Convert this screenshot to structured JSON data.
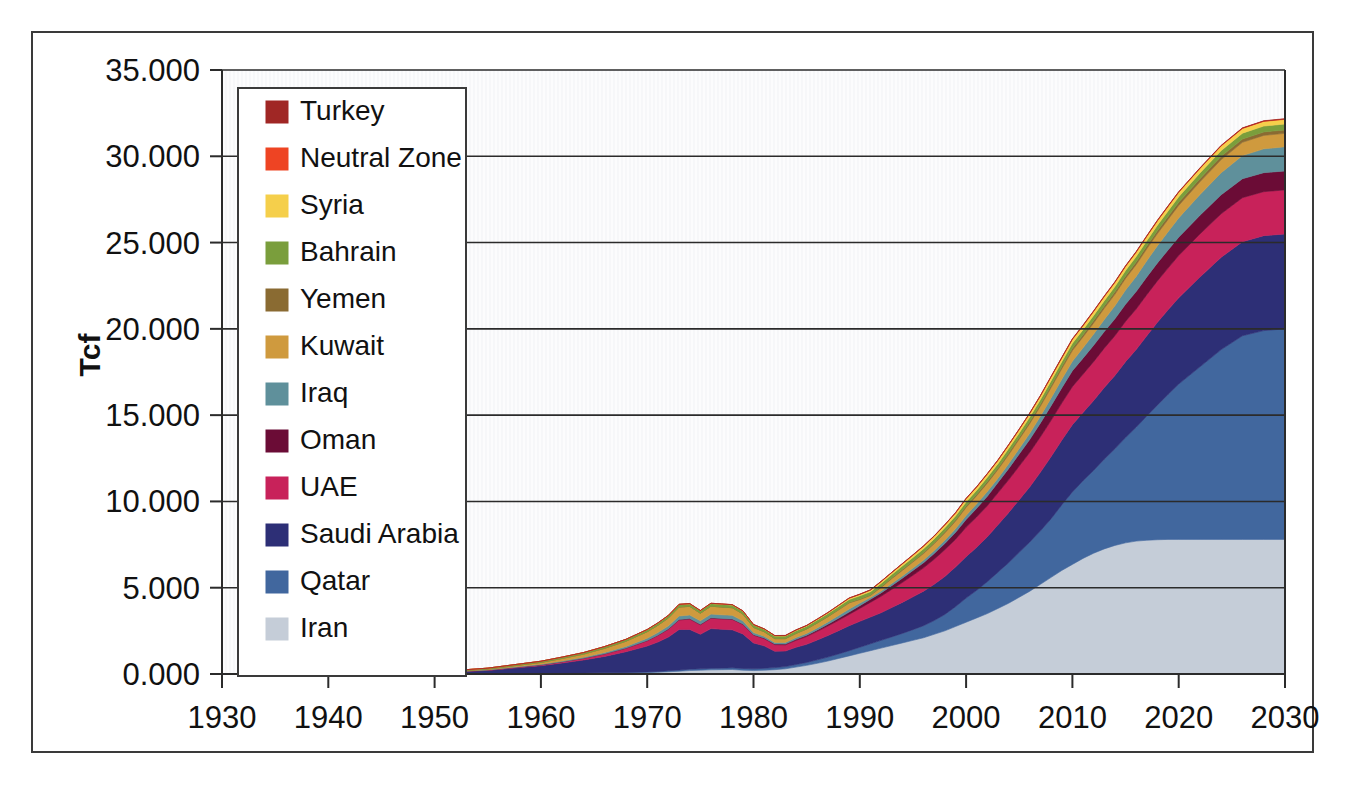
{
  "chart_data": {
    "type": "area",
    "stacked": true,
    "title": "",
    "xlabel": "",
    "ylabel": "Tcf",
    "xlim": [
      1930,
      2030
    ],
    "ylim": [
      0,
      35
    ],
    "xticks": [
      1930,
      1940,
      1950,
      1960,
      1970,
      1980,
      1990,
      2000,
      2010,
      2020,
      2030
    ],
    "xtick_labels": [
      "1930",
      "1940",
      "1950",
      "1960",
      "1970",
      "1980",
      "1990",
      "2000",
      "2010",
      "2020",
      "2030"
    ],
    "yticks": [
      0,
      5,
      10,
      15,
      20,
      25,
      30,
      35
    ],
    "ytick_labels": [
      "0.000",
      "5.000",
      "10.000",
      "15.000",
      "20.000",
      "25.000",
      "30.000",
      "35.000"
    ],
    "grid": "horizontal",
    "legend_position": "upper-left-inside",
    "legend_order_top_to_bottom": [
      "Turkey",
      "Neutral Zone",
      "Syria",
      "Bahrain",
      "Yemen",
      "Kuwait",
      "Iraq",
      "Oman",
      "UAE",
      "Saudi Arabia",
      "Qatar",
      "Iran"
    ],
    "x": [
      1930,
      1935,
      1940,
      1945,
      1950,
      1955,
      1960,
      1962,
      1964,
      1966,
      1968,
      1970,
      1971,
      1972,
      1973,
      1974,
      1975,
      1976,
      1977,
      1978,
      1979,
      1980,
      1981,
      1982,
      1983,
      1984,
      1985,
      1986,
      1987,
      1988,
      1989,
      1990,
      1991,
      1992,
      1993,
      1994,
      1995,
      1996,
      1997,
      1998,
      1999,
      2000,
      2001,
      2002,
      2003,
      2004,
      2005,
      2006,
      2007,
      2008,
      2009,
      2010,
      2011,
      2012,
      2013,
      2014,
      2015,
      2016,
      2017,
      2018,
      2019,
      2020,
      2022,
      2024,
      2026,
      2028,
      2030
    ],
    "series": [
      {
        "name": "Iran",
        "color": "#c5cdd8",
        "values": [
          0.0,
          0.0,
          0.0,
          0.0,
          0.0,
          0.01,
          0.02,
          0.03,
          0.04,
          0.05,
          0.06,
          0.08,
          0.1,
          0.13,
          0.16,
          0.2,
          0.22,
          0.24,
          0.25,
          0.26,
          0.22,
          0.2,
          0.22,
          0.25,
          0.3,
          0.4,
          0.5,
          0.62,
          0.75,
          0.9,
          1.05,
          1.2,
          1.35,
          1.5,
          1.65,
          1.8,
          1.95,
          2.1,
          2.3,
          2.5,
          2.75,
          3.0,
          3.25,
          3.5,
          3.8,
          4.1,
          4.45,
          4.8,
          5.2,
          5.6,
          6.0,
          6.35,
          6.7,
          7.0,
          7.25,
          7.45,
          7.6,
          7.7,
          7.75,
          7.78,
          7.8,
          7.8,
          7.8,
          7.8,
          7.8,
          7.8,
          7.8
        ]
      },
      {
        "name": "Qatar",
        "color": "#41679e",
        "values": [
          0.0,
          0.0,
          0.0,
          0.0,
          0.0,
          0.0,
          0.01,
          0.01,
          0.02,
          0.02,
          0.03,
          0.04,
          0.05,
          0.06,
          0.07,
          0.08,
          0.08,
          0.09,
          0.09,
          0.1,
          0.1,
          0.1,
          0.11,
          0.12,
          0.13,
          0.15,
          0.17,
          0.2,
          0.23,
          0.26,
          0.3,
          0.35,
          0.4,
          0.45,
          0.5,
          0.55,
          0.62,
          0.7,
          0.8,
          0.95,
          1.15,
          1.4,
          1.6,
          1.85,
          2.1,
          2.35,
          2.6,
          2.85,
          3.1,
          3.4,
          3.8,
          4.2,
          4.5,
          4.8,
          5.2,
          5.6,
          6.1,
          6.6,
          7.2,
          7.8,
          8.4,
          9.0,
          10.0,
          11.0,
          11.8,
          12.1,
          12.2
        ]
      },
      {
        "name": "Saudi Arabia",
        "color": "#2d2f76",
        "values": [
          0.0,
          0.0,
          0.0,
          0.02,
          0.08,
          0.2,
          0.45,
          0.6,
          0.75,
          0.95,
          1.2,
          1.5,
          1.7,
          1.95,
          2.35,
          2.3,
          2.0,
          2.3,
          2.25,
          2.2,
          2.0,
          1.5,
          1.3,
          0.95,
          0.9,
          1.0,
          1.05,
          1.15,
          1.25,
          1.35,
          1.45,
          1.5,
          1.55,
          1.6,
          1.7,
          1.8,
          1.9,
          2.0,
          2.1,
          2.2,
          2.3,
          2.4,
          2.5,
          2.6,
          2.75,
          2.9,
          3.05,
          3.2,
          3.4,
          3.6,
          3.75,
          3.9,
          3.95,
          4.05,
          4.15,
          4.25,
          4.4,
          4.5,
          4.65,
          4.8,
          4.9,
          5.0,
          5.2,
          5.35,
          5.45,
          5.5,
          5.5
        ]
      },
      {
        "name": "UAE",
        "color": "#c8225a",
        "values": [
          0.0,
          0.0,
          0.0,
          0.0,
          0.0,
          0.02,
          0.05,
          0.07,
          0.1,
          0.14,
          0.2,
          0.3,
          0.38,
          0.45,
          0.55,
          0.6,
          0.55,
          0.6,
          0.6,
          0.6,
          0.55,
          0.45,
          0.42,
          0.38,
          0.36,
          0.4,
          0.45,
          0.5,
          0.55,
          0.6,
          0.65,
          0.75,
          0.85,
          0.95,
          1.05,
          1.15,
          1.25,
          1.35,
          1.45,
          1.55,
          1.6,
          1.7,
          1.75,
          1.8,
          1.85,
          1.9,
          1.95,
          2.0,
          2.05,
          2.1,
          2.15,
          2.2,
          2.22,
          2.25,
          2.28,
          2.3,
          2.33,
          2.35,
          2.38,
          2.4,
          2.42,
          2.45,
          2.5,
          2.52,
          2.55,
          2.55,
          2.55
        ]
      },
      {
        "name": "Oman",
        "color": "#6b0c36",
        "values": [
          0.0,
          0.0,
          0.0,
          0.0,
          0.0,
          0.0,
          0.0,
          0.0,
          0.0,
          0.01,
          0.01,
          0.02,
          0.02,
          0.03,
          0.03,
          0.03,
          0.03,
          0.03,
          0.03,
          0.03,
          0.03,
          0.03,
          0.04,
          0.04,
          0.05,
          0.06,
          0.07,
          0.08,
          0.1,
          0.12,
          0.14,
          0.16,
          0.18,
          0.2,
          0.22,
          0.25,
          0.28,
          0.3,
          0.33,
          0.36,
          0.4,
          0.45,
          0.5,
          0.55,
          0.6,
          0.65,
          0.7,
          0.75,
          0.8,
          0.85,
          0.88,
          0.92,
          0.93,
          0.95,
          0.96,
          0.98,
          1.0,
          1.01,
          1.03,
          1.04,
          1.05,
          1.06,
          1.08,
          1.1,
          1.1,
          1.1,
          1.1
        ]
      },
      {
        "name": "Iraq",
        "color": "#5f909b",
        "values": [
          0.0,
          0.0,
          0.0,
          0.0,
          0.0,
          0.02,
          0.04,
          0.05,
          0.06,
          0.08,
          0.1,
          0.13,
          0.15,
          0.17,
          0.2,
          0.21,
          0.2,
          0.21,
          0.21,
          0.21,
          0.18,
          0.12,
          0.1,
          0.09,
          0.09,
          0.1,
          0.11,
          0.12,
          0.14,
          0.16,
          0.18,
          0.15,
          0.1,
          0.11,
          0.12,
          0.13,
          0.14,
          0.15,
          0.17,
          0.19,
          0.21,
          0.24,
          0.26,
          0.28,
          0.25,
          0.28,
          0.32,
          0.36,
          0.4,
          0.45,
          0.5,
          0.55,
          0.6,
          0.65,
          0.7,
          0.76,
          0.82,
          0.88,
          0.94,
          1.0,
          1.06,
          1.12,
          1.2,
          1.28,
          1.34,
          1.38,
          1.4
        ]
      },
      {
        "name": "Kuwait",
        "color": "#cf9a3e",
        "values": [
          0.0,
          0.0,
          0.0,
          0.0,
          0.01,
          0.04,
          0.1,
          0.14,
          0.18,
          0.24,
          0.3,
          0.38,
          0.42,
          0.46,
          0.52,
          0.5,
          0.44,
          0.46,
          0.45,
          0.44,
          0.4,
          0.3,
          0.26,
          0.22,
          0.22,
          0.24,
          0.26,
          0.28,
          0.3,
          0.32,
          0.35,
          0.2,
          0.12,
          0.2,
          0.28,
          0.32,
          0.35,
          0.38,
          0.4,
          0.42,
          0.44,
          0.46,
          0.47,
          0.48,
          0.5,
          0.52,
          0.54,
          0.56,
          0.58,
          0.6,
          0.61,
          0.62,
          0.63,
          0.64,
          0.65,
          0.66,
          0.67,
          0.68,
          0.69,
          0.7,
          0.71,
          0.72,
          0.74,
          0.76,
          0.77,
          0.78,
          0.78
        ]
      },
      {
        "name": "Yemen",
        "color": "#8a6b32",
        "values": [
          0.0,
          0.0,
          0.0,
          0.0,
          0.0,
          0.0,
          0.0,
          0.0,
          0.0,
          0.0,
          0.0,
          0.0,
          0.0,
          0.0,
          0.0,
          0.0,
          0.0,
          0.0,
          0.0,
          0.0,
          0.0,
          0.0,
          0.0,
          0.0,
          0.0,
          0.0,
          0.0,
          0.01,
          0.01,
          0.02,
          0.02,
          0.03,
          0.03,
          0.04,
          0.04,
          0.05,
          0.05,
          0.06,
          0.06,
          0.07,
          0.07,
          0.08,
          0.08,
          0.09,
          0.09,
          0.1,
          0.1,
          0.11,
          0.11,
          0.12,
          0.12,
          0.13,
          0.13,
          0.14,
          0.14,
          0.15,
          0.15,
          0.16,
          0.16,
          0.17,
          0.17,
          0.18,
          0.18,
          0.19,
          0.19,
          0.2,
          0.2
        ]
      },
      {
        "name": "Bahrain",
        "color": "#7a9e3c",
        "values": [
          0.0,
          0.0,
          0.01,
          0.02,
          0.03,
          0.05,
          0.07,
          0.08,
          0.09,
          0.1,
          0.11,
          0.12,
          0.13,
          0.14,
          0.15,
          0.15,
          0.15,
          0.16,
          0.16,
          0.16,
          0.16,
          0.15,
          0.15,
          0.15,
          0.15,
          0.16,
          0.16,
          0.17,
          0.17,
          0.18,
          0.18,
          0.19,
          0.19,
          0.2,
          0.2,
          0.21,
          0.21,
          0.22,
          0.22,
          0.23,
          0.23,
          0.24,
          0.24,
          0.25,
          0.25,
          0.26,
          0.26,
          0.27,
          0.27,
          0.28,
          0.28,
          0.29,
          0.29,
          0.3,
          0.3,
          0.3,
          0.31,
          0.31,
          0.31,
          0.32,
          0.32,
          0.32,
          0.33,
          0.33,
          0.34,
          0.34,
          0.34
        ]
      },
      {
        "name": "Syria",
        "color": "#f5cf4b",
        "values": [
          0.0,
          0.0,
          0.0,
          0.0,
          0.0,
          0.0,
          0.0,
          0.0,
          0.0,
          0.0,
          0.0,
          0.0,
          0.0,
          0.0,
          0.0,
          0.0,
          0.0,
          0.0,
          0.01,
          0.01,
          0.01,
          0.01,
          0.01,
          0.02,
          0.02,
          0.03,
          0.03,
          0.04,
          0.05,
          0.06,
          0.07,
          0.08,
          0.09,
          0.1,
          0.11,
          0.12,
          0.13,
          0.14,
          0.15,
          0.16,
          0.17,
          0.18,
          0.18,
          0.19,
          0.19,
          0.2,
          0.2,
          0.21,
          0.21,
          0.22,
          0.22,
          0.23,
          0.23,
          0.23,
          0.24,
          0.24,
          0.24,
          0.25,
          0.25,
          0.25,
          0.26,
          0.26,
          0.26,
          0.27,
          0.27,
          0.27,
          0.27
        ]
      },
      {
        "name": "Neutral Zone",
        "color": "#ee4423",
        "values": [
          0.0,
          0.0,
          0.0,
          0.0,
          0.0,
          0.0,
          0.0,
          0.0,
          0.0,
          0.0,
          0.0,
          0.01,
          0.01,
          0.01,
          0.01,
          0.01,
          0.01,
          0.01,
          0.01,
          0.01,
          0.01,
          0.01,
          0.01,
          0.01,
          0.01,
          0.01,
          0.01,
          0.01,
          0.01,
          0.01,
          0.01,
          0.01,
          0.01,
          0.01,
          0.01,
          0.01,
          0.02,
          0.02,
          0.02,
          0.02,
          0.02,
          0.02,
          0.02,
          0.02,
          0.02,
          0.02,
          0.02,
          0.02,
          0.02,
          0.02,
          0.02,
          0.02,
          0.02,
          0.02,
          0.02,
          0.02,
          0.02,
          0.02,
          0.02,
          0.02,
          0.02,
          0.02,
          0.02,
          0.02,
          0.02,
          0.02,
          0.02
        ]
      },
      {
        "name": "Turkey",
        "color": "#a02725",
        "values": [
          0.0,
          0.0,
          0.0,
          0.0,
          0.0,
          0.0,
          0.0,
          0.0,
          0.0,
          0.0,
          0.0,
          0.0,
          0.0,
          0.0,
          0.0,
          0.0,
          0.0,
          0.0,
          0.0,
          0.0,
          0.0,
          0.0,
          0.0,
          0.0,
          0.01,
          0.01,
          0.01,
          0.01,
          0.01,
          0.01,
          0.01,
          0.01,
          0.01,
          0.01,
          0.01,
          0.01,
          0.01,
          0.01,
          0.01,
          0.01,
          0.01,
          0.01,
          0.01,
          0.01,
          0.01,
          0.01,
          0.01,
          0.01,
          0.01,
          0.01,
          0.02,
          0.02,
          0.02,
          0.02,
          0.02,
          0.02,
          0.02,
          0.02,
          0.02,
          0.02,
          0.02,
          0.02,
          0.02,
          0.02,
          0.02,
          0.02,
          0.02
        ]
      }
    ]
  }
}
